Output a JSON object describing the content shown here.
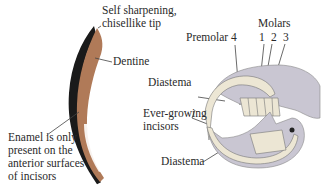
{
  "figure": {
    "tooth_panel": {
      "labels": {
        "tip": [
          "Self sharpening,",
          "chisellike tip"
        ],
        "dentine": "Dentine",
        "enamel": [
          "Enamel is only",
          "present on the",
          "anterior surfaces",
          "of incisors"
        ]
      }
    },
    "skull_panel": {
      "labels": {
        "premolar": "Premolar 4",
        "molars": "Molars",
        "molar_numbers": [
          "1",
          "2",
          "3"
        ],
        "diastema_upper": "Diastema",
        "incisors": [
          "Ever-growing",
          "incisors"
        ],
        "diastema_lower": "Diastema"
      }
    },
    "colors": {
      "dentine": "#b07a58",
      "enamel": "#1a1a1a",
      "skull": "#c9c6d2",
      "tooth": "#ece6d4",
      "line": "#444444"
    }
  }
}
